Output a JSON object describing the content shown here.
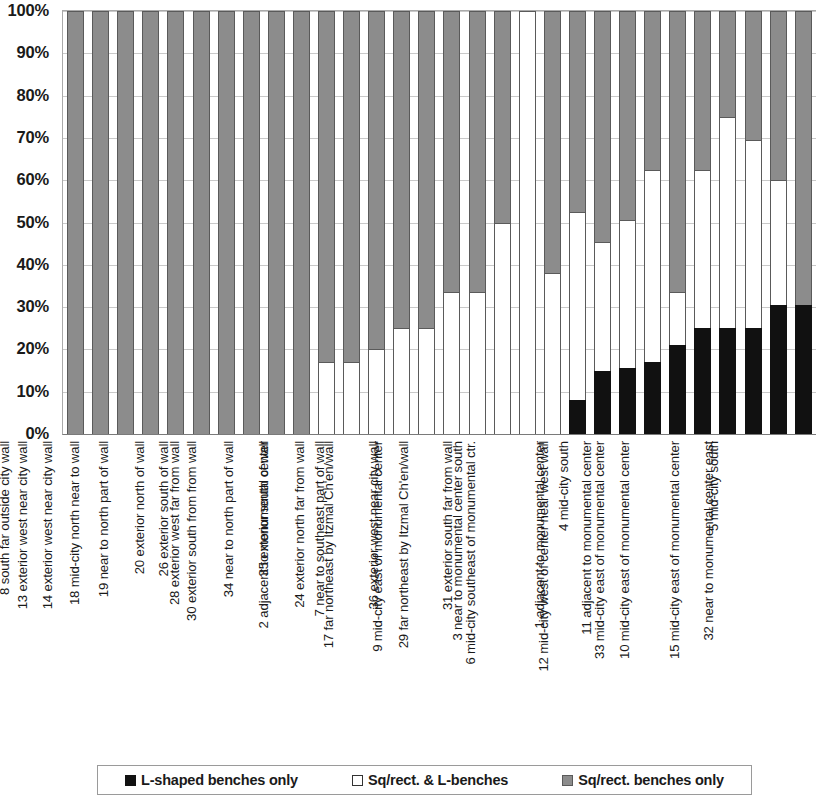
{
  "chart_data": {
    "type": "bar",
    "title": "",
    "subtitle": "",
    "xlabel": "",
    "ylabel": "",
    "stacked": true,
    "stack_mode": "percent",
    "grid": true,
    "legend_position": "bottom",
    "ylim": [
      0,
      100
    ],
    "y_ticks": [
      "0%",
      "10%",
      "20%",
      "30%",
      "40%",
      "50%",
      "60%",
      "70%",
      "80%",
      "90%",
      "100%"
    ],
    "y_tick_values": [
      0,
      10,
      20,
      30,
      40,
      50,
      60,
      70,
      80,
      90,
      100
    ],
    "categories": [
      "8 south far outside city wall",
      "13 exterior west near city wall",
      "14 exterior west near city wall",
      "18 mid-city north near to wall",
      "19 near to north part of wall",
      "20 exterior north of wall",
      "26 exterior south of wall",
      "28 exterior west far from wall",
      "30 exterior south from from wall",
      "34 near to north part of wall",
      "35 exterior south of wall",
      "2 adjacent to monumental center",
      "24 exterior north far from wall",
      "7 near to southeast part of wall",
      "17 far northeast by Itzmal Ch'en/wall",
      "36 exterior west near city wall",
      "9 mid-city east of monumental center",
      "29 far northeast by Itzmal Ch'en/wall",
      "31 exterior south far from wall",
      "3 near to monumental center south",
      "6 mid-city southeast of monumental ctr.",
      "4 mid-city south",
      "1 adjacent to monumental center",
      "12 mid-city west of center near west wall",
      "11 adjacent to monumental center",
      "33 mid-city east of monumental center",
      "10 mid-city east of monumental center",
      "5 mid-city south",
      "15 mid-city east of monumental center",
      "32 near to monumental center east"
    ],
    "series": [
      {
        "name": "L-shaped benches only",
        "color": "#111111",
        "values": [
          0,
          0,
          0,
          0,
          0,
          0,
          0,
          0,
          0,
          0,
          0,
          0,
          0,
          0,
          0,
          0,
          0,
          0,
          0,
          0,
          8,
          15,
          15.5,
          17,
          21,
          25,
          25,
          25,
          30.5,
          30.5
        ]
      },
      {
        "name": "Sq/rect. & L-benches",
        "color": "#ffffff",
        "values": [
          0,
          0,
          0,
          0,
          0,
          0,
          0,
          0,
          0,
          0,
          17,
          17,
          20,
          25,
          25,
          33.5,
          33.5,
          50,
          100,
          38,
          44.5,
          30.5,
          35,
          45.5,
          12.5,
          37.5,
          50,
          44.5,
          29.5,
          0
        ]
      },
      {
        "name": "Sq/rect. benches only",
        "color": "#8c8c8c",
        "values": [
          100,
          100,
          100,
          100,
          100,
          100,
          100,
          100,
          100,
          100,
          83,
          83,
          80,
          75,
          75,
          66.5,
          66.5,
          50,
          0,
          62,
          47.5,
          54.5,
          49.5,
          37.5,
          66.5,
          37.5,
          25,
          30.5,
          40,
          69.5
        ]
      }
    ]
  },
  "legend": {
    "items": [
      {
        "label": "L-shaped benches only",
        "swatch": "black-square-icon"
      },
      {
        "label": "Sq/rect. & L-benches",
        "swatch": "white-square-icon"
      },
      {
        "label": "Sq/rect. benches only",
        "swatch": "gray-square-icon"
      }
    ]
  }
}
